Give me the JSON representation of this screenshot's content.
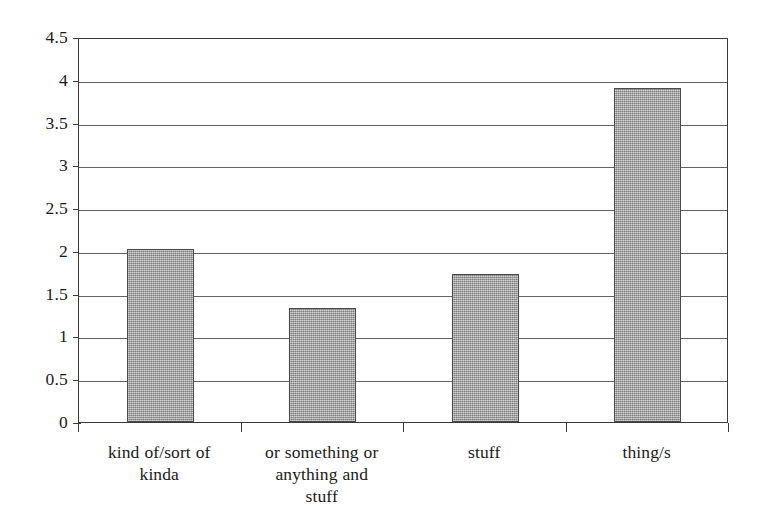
{
  "chart_data": {
    "type": "bar",
    "title": "",
    "subtitle": "",
    "xlabel": "",
    "ylabel": "",
    "categories": [
      "kind of/sort of kinda",
      "or something or anything and stuff",
      "stuff",
      "thing/s"
    ],
    "category_lines": [
      [
        "kind of/sort of",
        "kinda"
      ],
      [
        "or something or",
        "anything and",
        "stuff"
      ],
      [
        "stuff"
      ],
      [
        "thing/s"
      ]
    ],
    "values": [
      2.02,
      1.33,
      1.73,
      3.9
    ],
    "ylim": [
      0,
      4.5
    ],
    "ytick_labels": [
      "0",
      "0.5",
      "1",
      "1.5",
      "2",
      "2.5",
      "3",
      "3.5",
      "4",
      "4.5"
    ],
    "ytick_values": [
      0,
      0.5,
      1,
      1.5,
      2,
      2.5,
      3,
      3.5,
      4,
      4.5
    ],
    "grid": true,
    "legend": null,
    "legend_position": "none",
    "annotations": [],
    "colors": {
      "bar_fill": "#a9a9a9",
      "bar_edge": "#4a4a4a",
      "gridline": "#63635f",
      "axis": "#3b3b3b",
      "background": "#ffffff",
      "text": "#1a1a1a"
    }
  }
}
